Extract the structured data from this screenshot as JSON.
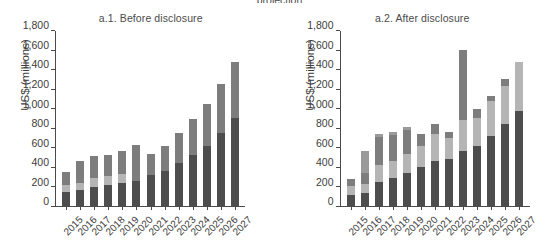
{
  "clipped_header": "projection",
  "axis": {
    "ylabel": "US$ (millions)",
    "yticks": [
      0,
      200,
      400,
      600,
      800,
      1000,
      1200,
      1400,
      1600,
      1800
    ],
    "ytick_labels": [
      "0",
      "200",
      "400",
      "600",
      "800",
      "1,000",
      "1,200",
      "1,400",
      "1,600",
      "1,800"
    ],
    "ymin": 0,
    "ymax": 1800
  },
  "colors": {
    "dark": "#4d4d4d",
    "medium": "#7d7d7d",
    "light": "#b5b5b5",
    "pale": "#cfcfcf",
    "axis": "#4a4a4a",
    "text": "#3c3c3c",
    "background": "#ffffff"
  },
  "panels": [
    {
      "id": "before-disclosure",
      "title": "a.1. Before disclosure",
      "ylabel": "US$ (millions)"
    },
    {
      "id": "after-disclosure",
      "title": "a.2. After disclosure",
      "ylabel": "US$ (millions)"
    }
  ],
  "chart_data": [
    {
      "type": "bar",
      "title": "a.1. Before disclosure",
      "xlabel": "",
      "ylabel": "US$ (millions)",
      "ylim": [
        0,
        1800
      ],
      "stacked": true,
      "grid": false,
      "legend": "none",
      "categories": [
        "2015",
        "2016",
        "2017",
        "2018",
        "2019",
        "2020",
        "2021",
        "2022",
        "2023",
        "2024",
        "2025",
        "2026",
        "2027"
      ],
      "series": [
        {
          "name": "segment-1-dark",
          "color": "#4d4d4d",
          "values": [
            140,
            165,
            200,
            215,
            240,
            260,
            320,
            360,
            440,
            520,
            620,
            755,
            910
          ]
        },
        {
          "name": "segment-2-light",
          "color": "#b5b5b5",
          "values": [
            75,
            75,
            90,
            95,
            85,
            0,
            0,
            0,
            0,
            0,
            0,
            0,
            0
          ]
        },
        {
          "name": "segment-3-medium",
          "color": "#7d7d7d",
          "values": [
            135,
            220,
            220,
            220,
            245,
            365,
            220,
            255,
            310,
            380,
            430,
            500,
            570
          ]
        }
      ],
      "totals": [
        350,
        460,
        510,
        530,
        570,
        625,
        540,
        615,
        750,
        900,
        1050,
        1255,
        1480
      ]
    },
    {
      "type": "bar",
      "title": "a.2. After disclosure",
      "xlabel": "",
      "ylabel": "US$ (millions)",
      "ylim": [
        0,
        1800
      ],
      "stacked": true,
      "grid": false,
      "legend": "none",
      "categories": [
        "2015",
        "2016",
        "2017",
        "2018",
        "2019",
        "2020",
        "2021",
        "2022",
        "2023",
        "2024",
        "2025",
        "2026",
        "2027"
      ],
      "series": [
        {
          "name": "segment-1-dark",
          "color": "#4d4d4d",
          "values": [
            115,
            130,
            250,
            285,
            340,
            405,
            465,
            480,
            570,
            620,
            720,
            845,
            975
          ]
        },
        {
          "name": "segment-2-light",
          "color": "#b5b5b5",
          "values": [
            90,
            95,
            170,
            180,
            190,
            215,
            280,
            220,
            320,
            290,
            360,
            390,
            505
          ]
        },
        {
          "name": "segment-3-medium",
          "color": "#7d7d7d",
          "values": [
            70,
            115,
            285,
            265,
            250,
            125,
            95,
            60,
            720,
            85,
            50,
            75,
            0
          ]
        },
        {
          "name": "segment-4-pale",
          "color": "#9a9a9a",
          "values": [
            0,
            225,
            35,
            35,
            35,
            0,
            0,
            0,
            0,
            0,
            0,
            0,
            0
          ]
        }
      ],
      "totals": [
        275,
        565,
        740,
        765,
        815,
        745,
        840,
        760,
        1610,
        995,
        1130,
        1310,
        1480
      ]
    }
  ]
}
